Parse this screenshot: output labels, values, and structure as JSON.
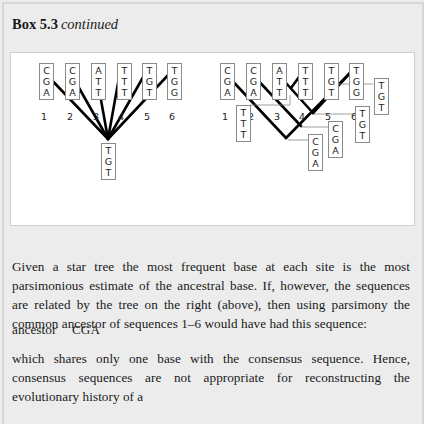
{
  "box": {
    "number": "Box 5.3",
    "subtitle": "continued"
  },
  "figure": {
    "star_tree": {
      "sequences": [
        {
          "label": "1",
          "bases": [
            "C",
            "G",
            "A"
          ]
        },
        {
          "label": "2",
          "bases": [
            "C",
            "G",
            "A"
          ]
        },
        {
          "label": "3",
          "bases": [
            "A",
            "T",
            "T"
          ]
        },
        {
          "label": "4",
          "bases": [
            "T",
            "T",
            "T"
          ]
        },
        {
          "label": "5",
          "bases": [
            "T",
            "G",
            "T"
          ]
        },
        {
          "label": "6",
          "bases": [
            "T",
            "G",
            "G"
          ]
        }
      ],
      "root": [
        "T",
        "G",
        "T"
      ]
    },
    "rooted_tree": {
      "sequences": [
        {
          "label": "1",
          "bases": [
            "C",
            "G",
            "A"
          ]
        },
        {
          "label": "2",
          "bases": [
            "C",
            "G",
            "A"
          ]
        },
        {
          "label": "3",
          "bases": [
            "A",
            "T",
            "T"
          ]
        },
        {
          "label": "4",
          "bases": [
            "T",
            "T",
            "T"
          ]
        },
        {
          "label": "5",
          "bases": [
            "T",
            "G",
            "T"
          ]
        },
        {
          "label": "6",
          "bases": [
            "T",
            "G",
            "G"
          ]
        }
      ],
      "internal_nodes": [
        {
          "node": "3-4",
          "bases": [
            "T",
            "T",
            "T"
          ]
        },
        {
          "node": "5-6",
          "bases": [
            "T",
            "G",
            "T"
          ]
        },
        {
          "node": "34-56",
          "bases": [
            "T",
            "G",
            "T"
          ]
        },
        {
          "node": "2-3456",
          "bases": [
            "C",
            "G",
            "A"
          ]
        },
        {
          "node": "root",
          "bases": [
            "C",
            "G",
            "A"
          ]
        }
      ]
    }
  },
  "text": {
    "para1": "Given a star tree the most frequent base at each site is the most parsimonious estimate of the ancestral base. If, however, the sequences are related by the tree on the right (above), then using parsimony the common ancestor of sequences 1–6 would have had this sequence:",
    "ancestor_label": "ancestor",
    "ancestor_seq": "CGA",
    "para2": "which shares only one base with the consensus sequence. Hence, consensus sequences are not appropriate for reconstructing the evolutionary history of a"
  }
}
